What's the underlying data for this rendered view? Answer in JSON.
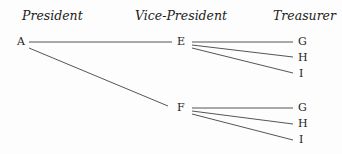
{
  "headers": {
    "president": "President",
    "vice_president": "Vice-President",
    "treasurer": "Treasurer"
  },
  "nodes": {
    "a": "A",
    "e": "E",
    "f": "F",
    "e_children": [
      "G",
      "H",
      "I"
    ],
    "f_children": [
      "G",
      "H",
      "I"
    ]
  },
  "colors": {
    "line": "#555555",
    "text": "#222222"
  }
}
